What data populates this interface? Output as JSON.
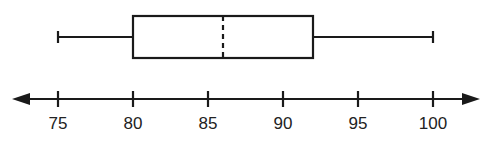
{
  "chart_data": {
    "type": "boxplot",
    "title": "",
    "xlabel": "",
    "ylabel": "",
    "xlim": [
      75,
      100
    ],
    "ticks": [
      75,
      80,
      85,
      90,
      95,
      100
    ],
    "tick_labels": [
      "75",
      "80",
      "85",
      "90",
      "95",
      "100"
    ],
    "grid": false,
    "legend": null,
    "box": {
      "min": 75,
      "q1": 80,
      "median": 86,
      "q3": 92,
      "max": 100,
      "median_style": "dashed"
    },
    "axis": {
      "arrows": "both"
    }
  },
  "colors": {
    "stroke": "#1a1a1a",
    "background": "#ffffff"
  }
}
